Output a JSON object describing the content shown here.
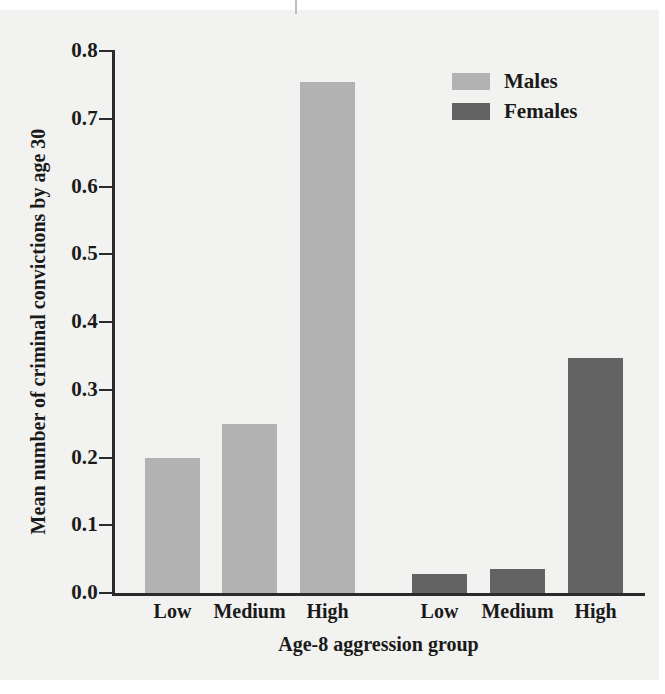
{
  "chart_data": {
    "type": "bar",
    "title": "",
    "xlabel": "Age-8 aggression group",
    "ylabel": "Mean number of criminal convictions by age 30",
    "ylim": [
      0.0,
      0.8
    ],
    "ytick_labels": [
      "0.0",
      "0.1",
      "0.2",
      "0.3",
      "0.4",
      "0.5",
      "0.6",
      "0.7",
      "0.8"
    ],
    "ytick_values": [
      0.0,
      0.1,
      0.2,
      0.3,
      0.4,
      0.5,
      0.6,
      0.7,
      0.8
    ],
    "categories": [
      "Low",
      "Medium",
      "High"
    ],
    "grid": false,
    "legend_position": "top-right",
    "series": [
      {
        "name": "Males",
        "color": "#b2b2b2",
        "categories": [
          "Low",
          "Medium",
          "High"
        ],
        "values": [
          0.2,
          0.249,
          0.755
        ]
      },
      {
        "name": "Females",
        "color": "#636363",
        "categories": [
          "Low",
          "Medium",
          "High"
        ],
        "values": [
          0.028,
          0.035,
          0.347
        ]
      }
    ],
    "bars": [
      {
        "group": "Males",
        "category": "Low",
        "value": 0.2,
        "color": "#b2b2b2",
        "x": 145,
        "width": 55
      },
      {
        "group": "Males",
        "category": "Medium",
        "value": 0.249,
        "color": "#b2b2b2",
        "x": 222,
        "width": 55
      },
      {
        "group": "Males",
        "category": "High",
        "value": 0.755,
        "color": "#b2b2b2",
        "x": 300,
        "width": 55
      },
      {
        "group": "Females",
        "category": "Low",
        "value": 0.028,
        "color": "#636363",
        "x": 412,
        "width": 55
      },
      {
        "group": "Females",
        "category": "Medium",
        "value": 0.035,
        "color": "#636363",
        "x": 490,
        "width": 55
      },
      {
        "group": "Females",
        "category": "High",
        "value": 0.347,
        "color": "#636363",
        "x": 568,
        "width": 55
      }
    ],
    "xtick_labels": [
      "Low",
      "Medium",
      "High",
      "Low",
      "Medium",
      "High"
    ]
  },
  "legend": {
    "items": [
      {
        "label": "Males",
        "color": "#b2b2b2"
      },
      {
        "label": "Females",
        "color": "#636363"
      }
    ]
  },
  "axes": {
    "y_title": "Mean number of criminal convictions by age 30",
    "x_title": "Age-8 aggression group"
  }
}
